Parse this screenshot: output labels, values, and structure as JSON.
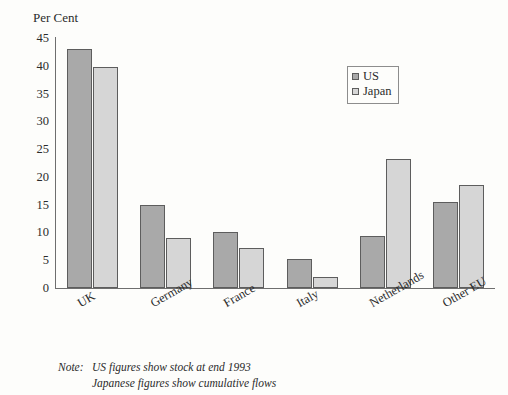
{
  "title_sliver": "",
  "axis_title": "Per Cent",
  "legend": {
    "position": "top-right",
    "items": [
      {
        "label": "US",
        "swatch": "us-swatch",
        "color": "#a9a9a9"
      },
      {
        "label": "Japan",
        "swatch": "japan-swatch",
        "color": "#d6d6d6"
      }
    ]
  },
  "note": {
    "label": "Note:",
    "line1": "US figures show stock at end 1993",
    "line2": "Japanese figures show cumulative flows"
  },
  "colors": {
    "us_bar": "#a9a9a9",
    "japan_bar": "#d6d6d6",
    "bar_outline": "#5d5d5d",
    "axis": "#6e6e6e",
    "background": "#fdfdfb",
    "text": "#2b2b2b"
  },
  "chart_data": {
    "type": "bar",
    "title": "",
    "subtitle": "",
    "xlabel": "",
    "ylabel": "Per Cent",
    "ylim": [
      0,
      45
    ],
    "yticks": [
      0,
      5,
      10,
      15,
      20,
      25,
      30,
      35,
      40,
      45
    ],
    "ytick_labels": [
      "0",
      "5",
      "10",
      "15",
      "20",
      "25",
      "30",
      "35",
      "40",
      "45"
    ],
    "grid": false,
    "legend_position": "top-right",
    "categories": [
      "UK",
      "Germany",
      "France",
      "Italy",
      "Netherlands",
      "Other EU"
    ],
    "series": [
      {
        "name": "US",
        "color": "#a9a9a9",
        "values": [
          43.0,
          15.0,
          10.0,
          5.2,
          9.4,
          15.4
        ]
      },
      {
        "name": "Japan",
        "color": "#d6d6d6",
        "values": [
          39.8,
          9.0,
          7.2,
          2.0,
          23.3,
          18.5
        ]
      }
    ],
    "annotations": [
      "Note: US figures show stock at end 1993",
      "Japanese figures show cumulative flows"
    ]
  }
}
